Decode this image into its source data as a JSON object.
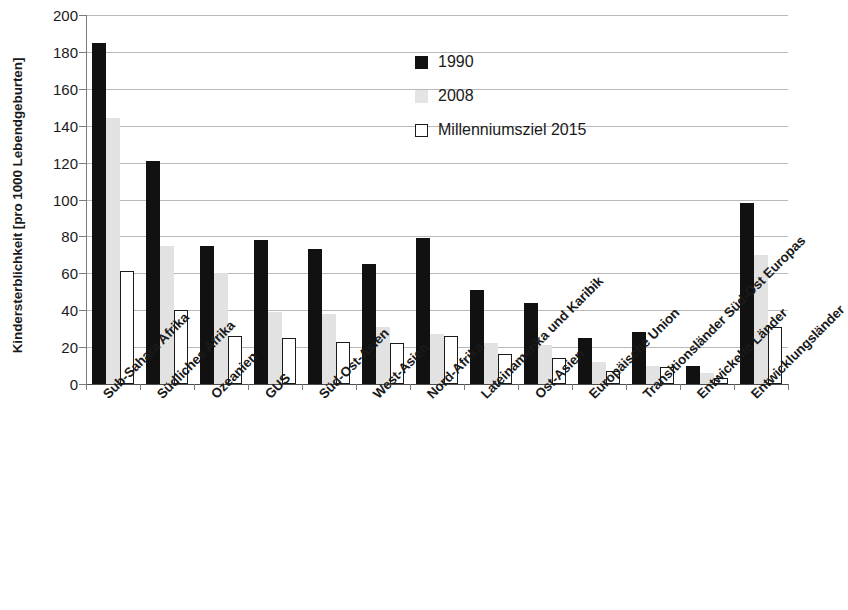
{
  "chart_data": {
    "type": "bar",
    "title": "",
    "xlabel": "",
    "ylabel": "Kindersterblichkeit [pro 1000 Lebendgeburten]",
    "ylim": [
      0,
      200
    ],
    "ytick_step": 20,
    "yticks": [
      200,
      180,
      160,
      140,
      120,
      100,
      80,
      60,
      40,
      20,
      0
    ],
    "grid": "horizontal",
    "legend_position": "inside-top-center",
    "categories": [
      "Sub-Sahara Afrika",
      "Südliches Afrika",
      "Ozeanien",
      "GUS",
      "Süd-Ost-Asien",
      "West-Asien",
      "Nord-Afrika",
      "Lateinamerika und Karibik",
      "Ost-Asien",
      "Europäische Union",
      "Transitionsländer Süd-Ost Europas",
      "Entwickelte Länder",
      "Entwicklungsländer"
    ],
    "series": [
      {
        "name": "1990",
        "color": "#111111",
        "values": [
          185,
          121,
          75,
          78,
          73,
          65,
          79,
          51,
          44,
          25,
          28,
          10,
          98
        ]
      },
      {
        "name": "2008",
        "color": "#e2e2e2",
        "values": [
          144,
          75,
          60,
          39,
          38,
          31,
          27,
          22,
          21,
          12,
          10,
          6,
          70
        ]
      },
      {
        "name": "Millenniumsziel 2015",
        "color": "#ffffff",
        "values": [
          61,
          40,
          26,
          25,
          23,
          22,
          26,
          16,
          14,
          7,
          9,
          3,
          31
        ]
      }
    ]
  },
  "legend": {
    "items": [
      {
        "label": "1990",
        "swatch": "s1990"
      },
      {
        "label": "2008",
        "swatch": "s2008"
      },
      {
        "label": "Millenniumsziel 2015",
        "swatch": "smdg"
      }
    ]
  }
}
